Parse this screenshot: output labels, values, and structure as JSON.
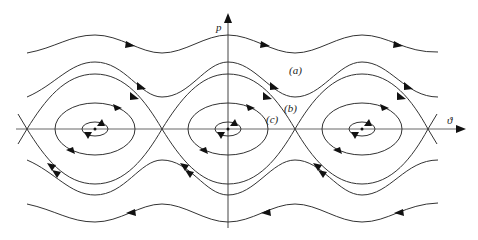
{
  "figure": {
    "type": "phase-portrait",
    "axes": {
      "vertical_label": "p",
      "horizontal_label": "ϑ"
    },
    "curve_labels": {
      "a": "(a)",
      "b": "(b)",
      "c": "(c)"
    },
    "line_color": "#333333",
    "arrow_color": "#111111",
    "centers_x": [
      95,
      228,
      362
    ],
    "saddles_x": [
      27,
      162,
      295,
      428
    ],
    "axis_y": 129
  }
}
